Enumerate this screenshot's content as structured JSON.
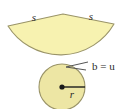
{
  "figure": {
    "name": "cone-net-sector-and-base-circle",
    "background_color": "#ffffff",
    "sector": {
      "fill_color": "#F7F2B0",
      "stroke_color": "#9a9468",
      "apex_x": 63,
      "apex_y": 14,
      "left_corner_x": 8,
      "left_corner_y": 26,
      "right_corner_x": 114,
      "right_corner_y": 24,
      "arc_lowest_x": 62,
      "arc_lowest_y": 66,
      "slant_label_left": "s",
      "slant_label_right": "s"
    },
    "circle": {
      "fill_color": "#EDE6A4",
      "stroke_color": "#9a9468",
      "center_x": 62,
      "center_y": 87,
      "radius": 23,
      "center_dot_color": "#1a1a1a",
      "radius_line_color": "#1a1a1a",
      "radius_label": "r"
    },
    "leader": {
      "stroke_color": "#555555",
      "tip_x": 66,
      "tip_y": 67,
      "label": "b = u"
    },
    "labels": {
      "slant_left": "s",
      "slant_right": "s",
      "radius": "r",
      "base_circumference": "b = u"
    }
  }
}
